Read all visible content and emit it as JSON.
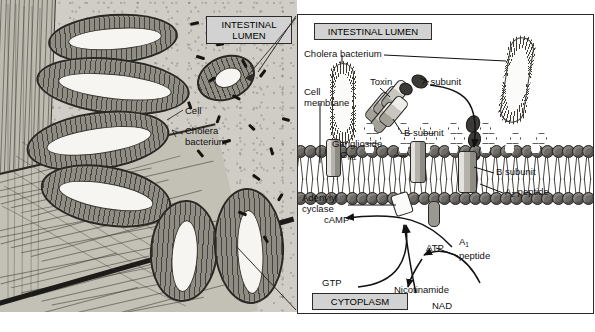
{
  "figure": {
    "colors": {
      "caption_box_fill": "#d2d2d2",
      "caption_box_border": "#2b2b2b",
      "panel_border": "#2b2b2b",
      "lipid_head": "#6e6b66",
      "lipid_tail": "#4b4843",
      "subunit_dark": "#3c3a36",
      "subunit_grey": "#9b9892",
      "histology_bg": "#cfcdc6",
      "page_bg": "#ffffff"
    }
  },
  "left_panel": {
    "name": "intestinal-histology-illustration",
    "caption_box": "INTESTINAL\nLUMEN",
    "labels": [
      {
        "id": "cell",
        "text": "Cell"
      },
      {
        "id": "cholera-bacterium",
        "text": "Cholera\nbacterium"
      }
    ]
  },
  "right_panel": {
    "name": "cholera-toxin-mechanism-diagram",
    "caption_top": "INTESTINAL LUMEN",
    "caption_bottom": "CYTOPLASM",
    "labels": [
      {
        "id": "cholera-bacterium",
        "text": "Cholera bacterium"
      },
      {
        "id": "cell-membrane",
        "text": "Cell\nmembrane"
      },
      {
        "id": "toxin",
        "text": "Toxin"
      },
      {
        "id": "a-subunit",
        "text": "A subunit"
      },
      {
        "id": "b-subunit-upper",
        "text": "B subunit"
      },
      {
        "id": "b-subunit-right",
        "text": "B subunit"
      },
      {
        "id": "ganglioside-line1",
        "text": "Ganglioside"
      },
      {
        "id": "ganglioside-line2",
        "text": "G",
        "subscript": "M1"
      },
      {
        "id": "a2-peptide",
        "text": "A",
        "subscript": "2",
        "tail": " peptide"
      },
      {
        "id": "adenylyl-cyclase",
        "text": "Adenylyl\ncyclase"
      },
      {
        "id": "camp",
        "text": "cAMP"
      },
      {
        "id": "gtp",
        "text": "GTP"
      },
      {
        "id": "atp",
        "text": "ATP"
      },
      {
        "id": "a1-peptide",
        "text": "A",
        "subscript": "1",
        "tail": "peptide"
      },
      {
        "id": "adp-ribose",
        "text": "ADP–ribose"
      },
      {
        "id": "nicotinamide",
        "text": "Nicotinamide"
      },
      {
        "id": "nad",
        "text": "NAD"
      }
    ]
  }
}
